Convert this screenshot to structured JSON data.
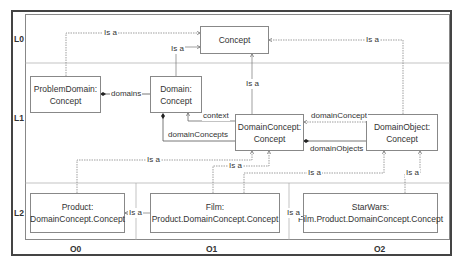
{
  "lanes": {
    "rows": [
      "L0",
      "L1",
      "L2"
    ],
    "columns": [
      "O0",
      "O1",
      "O2"
    ]
  },
  "nodes": {
    "concept": {
      "line1": "Concept"
    },
    "problem_domain": {
      "line1": "ProblemDomain:",
      "line2": "Concept"
    },
    "domain": {
      "line1": "Domain:",
      "line2": "Concept"
    },
    "domain_concept": {
      "line1": "DomainConcept:",
      "line2": "Concept"
    },
    "domain_object": {
      "line1": "DomainObject:",
      "line2": "Concept"
    },
    "product": {
      "line1": "Product:",
      "line2": "DomainConcept.Concept"
    },
    "film": {
      "line1": "Film:",
      "line2": "Product.DomainConcept.Concept"
    },
    "starwars": {
      "line1": "StarWars:",
      "line2": "Film.Product.DomainConcept.Concept"
    }
  },
  "edges": {
    "problemdomain_isa": "Is a",
    "domain_isa": "Is a",
    "domainconcept_isa": "Is a",
    "domainobject_isa": "Is a",
    "domains": "domains",
    "context": "context",
    "domain_concepts": "domainConcepts",
    "domain_concept": "domainConcept",
    "domain_objects": "domainObjects",
    "product_isa_dc": "Is a",
    "film_isa_dc": "Is a",
    "product_film_isa": "Is a",
    "film_starwars_isa": "Is a",
    "starwars_isa_do": "Is a"
  }
}
